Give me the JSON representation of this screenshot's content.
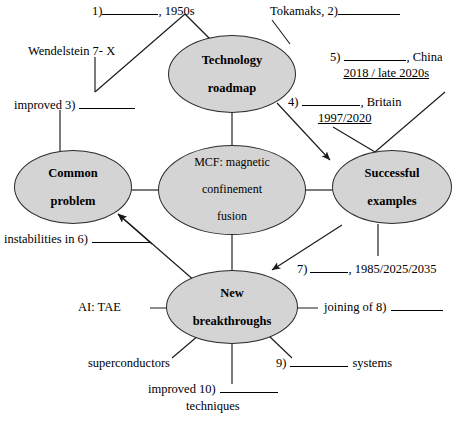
{
  "diagram": {
    "style": {
      "node_fill": "#d4d4d4",
      "node_stroke": "#2b2b2b",
      "line_color": "#1a1a1a",
      "background": "#ffffff"
    },
    "nodes": [
      {
        "id": "technology-roadmap",
        "line1": "Technology",
        "line2": "roadmap",
        "bold": true
      },
      {
        "id": "common-problem",
        "line1": "Common",
        "line2": "problem",
        "bold": true
      },
      {
        "id": "mcf-center",
        "line1": "MCF: magnetic",
        "line2": "confinement",
        "line3": "fusion",
        "bold": false
      },
      {
        "id": "successful-examples",
        "line1": "Successful",
        "line2": "examples",
        "bold": true
      },
      {
        "id": "new-breakthroughs",
        "line1": "New",
        "line2": "breakthroughs",
        "bold": true
      }
    ],
    "labels": {
      "gap1": {
        "pre": "1)",
        "post": ", 1950s"
      },
      "tokamaks": {
        "pre": "Tokamaks, 2)",
        "post": ""
      },
      "wendelstein": {
        "text": "Wendelstein 7- X"
      },
      "gap3": {
        "pre": "improved 3)",
        "post": ""
      },
      "gap5": {
        "pre": "5)",
        "post": ", China",
        "sub": "2018 / late 2020s"
      },
      "gap4": {
        "pre": "4)",
        "post": ", Britain",
        "sub": "1997/2020"
      },
      "gap6": {
        "pre": "instabilities in 6)",
        "post": ""
      },
      "gap7": {
        "pre": "7)",
        "post": ", 1985/2025/2035"
      },
      "ai_tae": {
        "text": "AI: TAE"
      },
      "gap8": {
        "pre": "joining of 8)",
        "post": ""
      },
      "superconductors": {
        "text": "superconductors"
      },
      "gap9": {
        "pre": "9)",
        "post": "systems"
      },
      "gap10": {
        "pre": "improved 10)",
        "post": "",
        "line2": "techniques"
      }
    }
  }
}
